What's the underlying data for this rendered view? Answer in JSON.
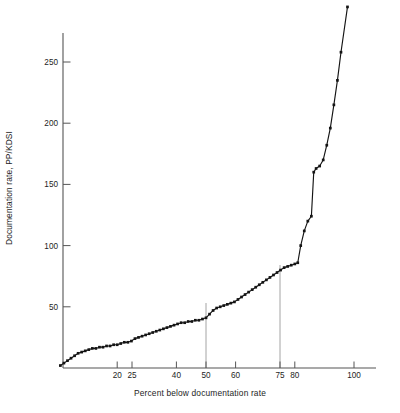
{
  "chart_data": {
    "type": "line",
    "title": "",
    "subtitle": "",
    "xlabel": "Percent below documentation rate",
    "ylabel": "Documentation rate, PP/KDSI",
    "xlim": [
      0,
      105
    ],
    "ylim": [
      0,
      300
    ],
    "grid": false,
    "legend": null,
    "marker": "filled-square",
    "line_color": "#141414",
    "axis_color": "#555555",
    "reference_line_color": "#9a9a9a",
    "xticks": [
      20,
      25,
      40,
      50,
      60,
      75,
      80,
      100
    ],
    "xtick_labels": [
      "20",
      "25",
      "40",
      "50",
      "60",
      "75",
      "80",
      "100"
    ],
    "yticks": [
      50,
      100,
      150,
      200,
      250
    ],
    "ytick_labels": [
      "50",
      "100",
      "150",
      "200",
      "250"
    ],
    "reference_lines_x": [
      50,
      75
    ],
    "series": [
      {
        "name": "Documentation rate distribution",
        "x": [
          0.8,
          2.0,
          3.2,
          4.4,
          5.6,
          6.8,
          8.0,
          9.2,
          10.4,
          11.6,
          12.8,
          14.0,
          15.2,
          16.4,
          17.6,
          18.8,
          20.0,
          21.2,
          22.4,
          23.6,
          24.8,
          26.0,
          27.2,
          28.4,
          29.6,
          30.8,
          32.0,
          33.2,
          34.4,
          35.6,
          36.8,
          38.0,
          39.2,
          40.4,
          41.6,
          42.8,
          44.0,
          45.2,
          46.4,
          47.6,
          48.8,
          50.0,
          51.2,
          52.4,
          53.6,
          54.8,
          56.0,
          57.2,
          58.4,
          59.6,
          60.8,
          62.0,
          63.2,
          64.4,
          65.6,
          66.8,
          68.0,
          69.2,
          70.4,
          71.6,
          72.8,
          74.0,
          75.2,
          76.4,
          77.6,
          78.8,
          80.0,
          81.0,
          82.0,
          83.2,
          84.4,
          85.6,
          86.4,
          87.2,
          88.4,
          89.6,
          90.8,
          92.0,
          93.2,
          94.4,
          95.6,
          97.8
        ],
        "y": [
          2,
          4,
          6,
          8,
          10,
          12,
          13,
          14,
          15,
          16,
          16,
          17,
          17,
          18,
          18,
          19,
          19,
          20,
          21,
          21,
          22,
          24,
          25,
          26,
          27,
          28,
          29,
          30,
          31,
          32,
          33,
          34,
          35,
          36,
          37,
          37,
          38,
          38,
          39,
          39,
          40,
          41,
          44,
          47,
          49,
          50,
          51,
          52,
          53,
          54,
          56,
          58,
          60,
          62,
          64,
          66,
          68,
          70,
          72,
          74,
          76,
          78,
          80,
          82,
          83,
          84,
          85,
          86,
          100,
          112,
          120,
          124,
          160,
          163,
          165,
          170,
          182,
          196,
          215,
          235,
          258,
          295
        ]
      }
    ]
  },
  "figure": {
    "background": "#ffffff",
    "width": 400,
    "height": 413
  }
}
